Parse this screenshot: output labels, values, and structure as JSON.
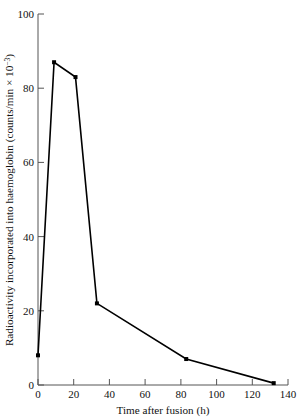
{
  "chart_data": {
    "type": "line",
    "title": "",
    "xlabel": "Time after fusion (h)",
    "ylabel": "Radioactivity incorporated into haemoglobin (counts/min × 10",
    "ylabel_exponent": "−3",
    "ylabel_suffix": ")",
    "ylabel_full": "Radioactivity incorporated into haemoglobin (counts/min × 10⁻³)",
    "xlim": [
      0,
      140
    ],
    "ylim": [
      0,
      100
    ],
    "xticks": [
      0,
      20,
      40,
      60,
      80,
      100,
      120,
      140
    ],
    "yticks": [
      0,
      20,
      40,
      60,
      80,
      100
    ],
    "xtick_labels": [
      "0",
      "20",
      "40",
      "60",
      "80",
      "100",
      "120",
      "140"
    ],
    "ytick_labels": [
      "0",
      "20",
      "40",
      "60",
      "80",
      "100"
    ],
    "grid": false,
    "legend": null,
    "marker": "square",
    "line_color": "#000000",
    "x": [
      0,
      9,
      21,
      33,
      83,
      132
    ],
    "values": [
      8,
      87,
      83,
      22,
      7,
      0.5
    ],
    "points": [
      {
        "x": 0,
        "y": 8
      },
      {
        "x": 9,
        "y": 87
      },
      {
        "x": 21,
        "y": 83
      },
      {
        "x": 33,
        "y": 22
      },
      {
        "x": 83,
        "y": 7
      },
      {
        "x": 132,
        "y": 0.5
      }
    ]
  }
}
